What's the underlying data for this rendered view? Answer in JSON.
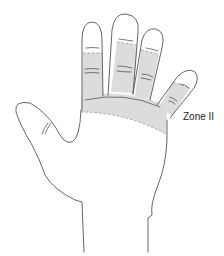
{
  "figure": {
    "labels": {
      "zone": "Zone II"
    },
    "colors": {
      "outline": "#555555",
      "zone_fill": "#dcdcdc",
      "zone_boundary": "#888888",
      "background": "#ffffff"
    }
  }
}
